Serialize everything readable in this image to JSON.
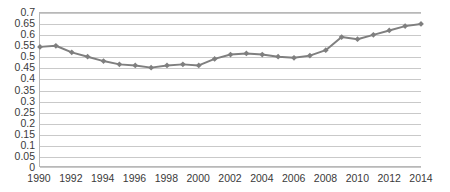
{
  "chart_data": {
    "type": "line",
    "title": "",
    "subtitle": "",
    "xlabel": "",
    "ylabel": "",
    "legend": [],
    "legend_position": "none",
    "grid": true,
    "grid_axis": "y",
    "xlim": [
      1990,
      2014
    ],
    "ylim": [
      0,
      0.7
    ],
    "x": [
      1990,
      1991,
      1992,
      1993,
      1994,
      1995,
      1996,
      1997,
      1998,
      1999,
      2000,
      2001,
      2002,
      2003,
      2004,
      2005,
      2006,
      2007,
      2008,
      2009,
      2010,
      2011,
      2012,
      2013,
      2014
    ],
    "values": [
      0.545,
      0.55,
      0.52,
      0.5,
      0.48,
      0.465,
      0.46,
      0.45,
      0.46,
      0.465,
      0.46,
      0.49,
      0.51,
      0.515,
      0.51,
      0.5,
      0.495,
      0.505,
      0.53,
      0.59,
      0.58,
      0.6,
      0.62,
      0.64,
      0.65
    ],
    "series": [
      {
        "name": "series-1",
        "color": "#7f7f7f",
        "marker": "diamond",
        "values": [
          0.545,
          0.55,
          0.52,
          0.5,
          0.48,
          0.465,
          0.46,
          0.45,
          0.46,
          0.465,
          0.46,
          0.49,
          0.51,
          0.515,
          0.51,
          0.5,
          0.495,
          0.505,
          0.53,
          0.59,
          0.58,
          0.6,
          0.62,
          0.64,
          0.65
        ]
      }
    ],
    "y_ticks": [
      0,
      0.05,
      0.1,
      0.15,
      0.2,
      0.25,
      0.3,
      0.35,
      0.4,
      0.45,
      0.5,
      0.55,
      0.6,
      0.65,
      0.7
    ],
    "y_tick_labels": [
      "0",
      "0.05",
      "0.1",
      "0.15",
      "0.2",
      "0.25",
      "0.3",
      "0.35",
      "0.4",
      "0.45",
      "0.5",
      "0.55",
      "0.6",
      "0.65",
      "0.7"
    ],
    "x_ticks": [
      1990,
      1992,
      1994,
      1996,
      1998,
      2000,
      2002,
      2004,
      2006,
      2008,
      2010,
      2012,
      2014
    ],
    "x_tick_labels": [
      "1990",
      "1992",
      "1994",
      "1996",
      "1998",
      "2000",
      "2002",
      "2004",
      "2006",
      "2008",
      "2010",
      "2012",
      "2014"
    ]
  },
  "colors": {
    "series_line": "#7f7f7f",
    "marker_fill": "#7f7f7f",
    "gridline": "#c9c9c9",
    "axis_border": "#b8b8b8",
    "tick_text": "#3a3a3a",
    "plot_background": "#ffffff"
  }
}
